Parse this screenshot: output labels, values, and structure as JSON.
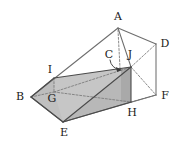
{
  "figure": {
    "type": "3d-geometry-diagram",
    "background_color": "#ffffff",
    "stroke_color": "#6b6b6b",
    "dark_stroke_color": "#3a3a3a",
    "hidden_stroke_color": "#8a8a8a",
    "fill_light": "#c9c9c9",
    "fill_mid": "#bdbdbd",
    "fill_dark": "#a8a8a8",
    "label_color": "#1a1a1a",
    "label_font_size": 11
  },
  "vertices": [
    {
      "id": "A",
      "label": "A",
      "x": 118,
      "y": 28,
      "label_x": 118,
      "label_y": 17
    },
    {
      "id": "B",
      "label": "B",
      "x": 31,
      "y": 97,
      "label_x": 20,
      "label_y": 97
    },
    {
      "id": "C",
      "label": "C",
      "x": 121,
      "y": 70,
      "label_x": 109,
      "label_y": 55
    },
    {
      "id": "D",
      "label": "D",
      "x": 156,
      "y": 44,
      "label_x": 165,
      "label_y": 44
    },
    {
      "id": "E",
      "label": "E",
      "x": 63,
      "y": 122,
      "label_x": 64,
      "label_y": 133
    },
    {
      "id": "F",
      "label": "F",
      "x": 156,
      "y": 95,
      "label_x": 165,
      "label_y": 96
    },
    {
      "id": "G",
      "label": "G",
      "x": 54,
      "y": 92,
      "label_x": 52,
      "label_y": 99
    },
    {
      "id": "H",
      "label": "H",
      "x": 131,
      "y": 102,
      "label_x": 132,
      "label_y": 113
    },
    {
      "id": "I",
      "label": "I",
      "x": 54,
      "y": 78,
      "label_x": 50,
      "label_y": 70
    },
    {
      "id": "J",
      "label": "J",
      "x": 131,
      "y": 67,
      "label_x": 130,
      "label_y": 55
    }
  ],
  "faces": [
    {
      "id": "face-BEJI",
      "points": "31,97 63,122 131,67 54,78",
      "fill": "#c9c9c9",
      "note": "large shaded slanted face"
    },
    {
      "id": "face-BGI",
      "points": "31,97 54,92 54,78",
      "fill": "#bdbdbd",
      "note": "left triangular end"
    },
    {
      "id": "face-JH-right",
      "points": "131,67 131,102 121,102 121,70",
      "fill": "#a8a8a8",
      "note": "dark right end face"
    },
    {
      "id": "face-EJH",
      "points": "63,122 131,67 131,102",
      "fill": "#b5b5b5",
      "note": "lower front band"
    }
  ],
  "solid_edges": [
    {
      "id": "A-B",
      "from": "A",
      "to": "B"
    },
    {
      "id": "A-D",
      "from": "A",
      "to": "D"
    },
    {
      "id": "A-J-guide",
      "from": "A",
      "to": "J"
    },
    {
      "id": "B-E",
      "from": "B",
      "to": "E"
    },
    {
      "id": "B-I",
      "from": "B",
      "to": "I"
    },
    {
      "id": "D-F",
      "from": "D",
      "to": "F"
    },
    {
      "id": "E-F",
      "from": "E",
      "to": "F"
    },
    {
      "id": "E-J",
      "from": "E",
      "to": "J"
    },
    {
      "id": "I-J",
      "from": "I",
      "to": "J"
    },
    {
      "id": "J-H",
      "from": "J",
      "to": "H"
    },
    {
      "id": "E-H",
      "from": "E",
      "to": "H"
    }
  ],
  "hidden_edges": [
    {
      "id": "B-G",
      "from": "B",
      "to": "G"
    },
    {
      "id": "I-G",
      "from": "I",
      "to": "G"
    },
    {
      "id": "G-H",
      "from": "G",
      "to": "H"
    },
    {
      "id": "G-J",
      "from": "G",
      "to": "J"
    },
    {
      "id": "A-C",
      "from": "A",
      "to": "C"
    },
    {
      "id": "H-F",
      "from": "H",
      "to": "F"
    },
    {
      "id": "J-D",
      "from": "J",
      "to": "D"
    },
    {
      "id": "J-F",
      "from": "J",
      "to": "F"
    }
  ],
  "annotations": [
    {
      "id": "C-pointer",
      "label": "C",
      "note": "curved arrow from label C to interior point near J"
    }
  ]
}
